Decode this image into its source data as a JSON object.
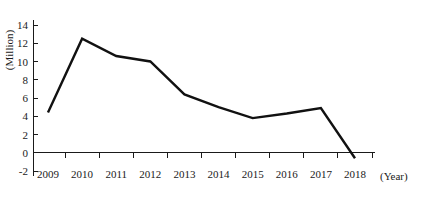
{
  "chart_data": {
    "type": "line",
    "title": "",
    "subtitle": "",
    "xlabel": "(Year)",
    "ylabel": "(Million)",
    "categories": [
      "2009",
      "2010",
      "2011",
      "2012",
      "2013",
      "2014",
      "2015",
      "2016",
      "2017",
      "2018"
    ],
    "values": [
      4.4,
      12.5,
      10.6,
      10.0,
      6.4,
      5.0,
      3.8,
      4.3,
      4.9,
      -0.6
    ],
    "series": [
      {
        "name": "",
        "values": [
          4.4,
          12.5,
          10.6,
          10.0,
          6.4,
          5.0,
          3.8,
          4.3,
          4.9,
          -0.6
        ]
      }
    ],
    "ylim": [
      -2,
      14
    ],
    "ytick_labels": [
      "14",
      "12",
      "10",
      "8",
      "6",
      "4",
      "2",
      "0",
      "-2"
    ],
    "ytick_values": [
      14,
      12,
      10,
      8,
      6,
      4,
      2,
      0,
      -2
    ],
    "xtick_labels": [
      "2009",
      "2010",
      "2011",
      "2012",
      "2013",
      "2014",
      "2015",
      "2016",
      "2017",
      "2018"
    ],
    "grid": false,
    "legend": "none",
    "line_color": "#111111",
    "axis_color": "#1a1a1a",
    "background_color": "#ffffff",
    "zero_line": 0
  },
  "axis_labels": {
    "y_unit": "(Million)",
    "x_unit": "(Year)"
  }
}
